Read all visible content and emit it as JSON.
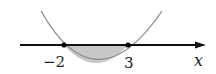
{
  "diagram": {
    "type": "parabola-sign-chart",
    "axis_label": "x",
    "roots": [
      {
        "label": "−2",
        "value": -2
      },
      {
        "label": "3",
        "value": 3
      }
    ],
    "shaded_region": "below x-axis between roots",
    "colors": {
      "curve": "#8a8a8a",
      "axis": "#111111",
      "shade": "#c8c8c8",
      "points": "#000000"
    }
  }
}
